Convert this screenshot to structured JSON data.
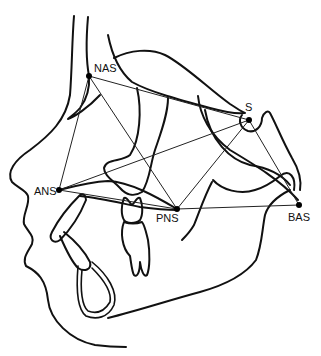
{
  "diagram": {
    "colors": {
      "stroke": "#111111",
      "background": "#ffffff"
    },
    "landmarks": [
      {
        "id": "NAS",
        "label": "NAS",
        "x": 89,
        "y": 76,
        "label_x": 94,
        "label_y": 63
      },
      {
        "id": "S",
        "label": "S",
        "x": 249,
        "y": 120,
        "label_x": 245,
        "label_y": 102
      },
      {
        "id": "ANS",
        "label": "ANS",
        "x": 59,
        "y": 190,
        "label_x": 34,
        "label_y": 188
      },
      {
        "id": "PNS",
        "label": "PNS",
        "x": 177,
        "y": 209,
        "label_x": 155,
        "label_y": 213
      },
      {
        "id": "BAS",
        "label": "BAS",
        "x": 299,
        "y": 205,
        "label_x": 287,
        "label_y": 212
      }
    ],
    "connections": [
      [
        "NAS",
        "S"
      ],
      [
        "NAS",
        "ANS"
      ],
      [
        "NAS",
        "PNS"
      ],
      [
        "S",
        "ANS"
      ],
      [
        "S",
        "PNS"
      ],
      [
        "S",
        "BAS"
      ],
      [
        "ANS",
        "PNS"
      ],
      [
        "PNS",
        "BAS"
      ]
    ]
  }
}
